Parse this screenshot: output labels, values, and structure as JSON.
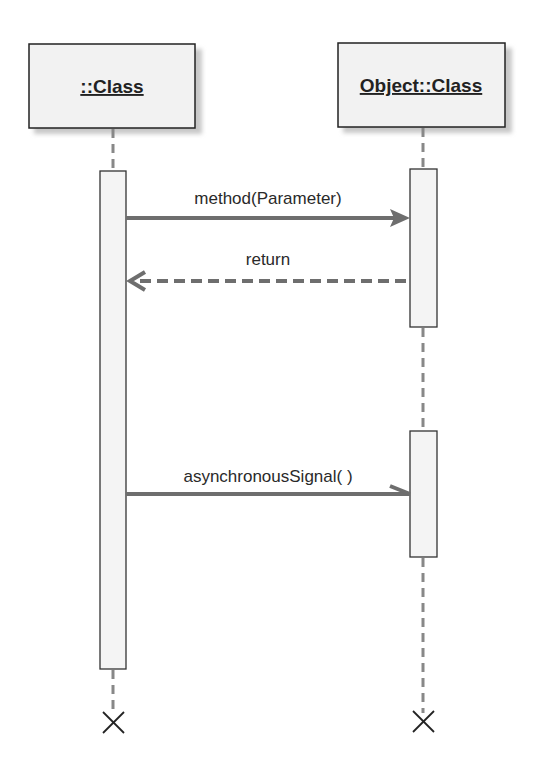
{
  "diagram": {
    "type": "UML sequence diagram",
    "colors": {
      "box_fill": "#f2f2f2",
      "box_border": "#222222",
      "shadow": "#c8c8c8",
      "lifeline": "#888888",
      "message": "#6e6e6e",
      "text": "#222222"
    },
    "lifelines": [
      {
        "id": "left",
        "label": "::Class",
        "x": 113
      },
      {
        "id": "right",
        "label": "Object::Class",
        "x": 423
      }
    ],
    "messages": [
      {
        "label": "method(Parameter)",
        "from": "left",
        "to": "right",
        "kind": "synchronous",
        "y": 218
      },
      {
        "label": "return",
        "from": "right",
        "to": "left",
        "kind": "reply",
        "y": 281
      },
      {
        "label": "asynchronousSignal( )",
        "from": "left",
        "to": "right",
        "kind": "asynchronous",
        "y": 494
      }
    ],
    "destruction_markers": [
      {
        "lifeline": "left",
        "symbol": "X"
      },
      {
        "lifeline": "right",
        "symbol": "X"
      }
    ]
  }
}
